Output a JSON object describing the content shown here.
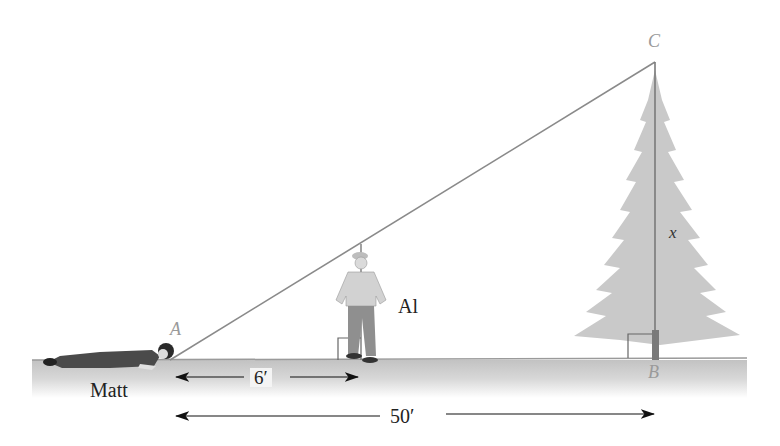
{
  "diagram": {
    "type": "similar-triangles-height-measurement",
    "points": {
      "A": "A",
      "B": "B",
      "C": "C"
    },
    "people": {
      "lying": "Matt",
      "standing": "Al"
    },
    "unknown": "x",
    "measurements": {
      "A_to_Al": "6′",
      "A_to_B": "50′"
    },
    "colors": {
      "ground": "#d4d4d4",
      "tree": "#c9c9c9",
      "line": "#8a8a8a",
      "point_label": "#9a9a9a",
      "text": "#222222"
    }
  }
}
